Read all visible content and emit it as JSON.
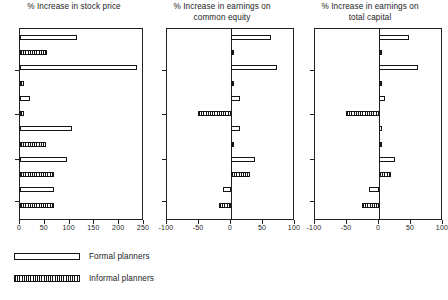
{
  "figure": {
    "width": 443,
    "height": 300,
    "background": "#ffffff",
    "ink_color": "#1a1a1a"
  },
  "legend": {
    "position": "bottom-left",
    "entries": [
      {
        "key": "formal",
        "label": "Formal planners",
        "pattern": "open"
      },
      {
        "key": "informal",
        "label": "Informal planners",
        "pattern": "hatched"
      }
    ]
  },
  "chart_data": [
    {
      "type": "bar",
      "orientation": "horizontal",
      "title": "% Increase in stock price",
      "xlabel": "",
      "ylabel": "",
      "xlim": [
        0,
        250
      ],
      "ticks": [
        0,
        50,
        100,
        150,
        200,
        250
      ],
      "tick_labels": [
        "0",
        "50",
        "100",
        "150",
        "200",
        "250"
      ],
      "grid": false,
      "zero_at": 0,
      "series": [
        {
          "name": "Formal planners",
          "pattern": "open"
        },
        {
          "name": "Informal planners",
          "pattern": "hatched"
        }
      ],
      "bars": [
        {
          "index": 1,
          "group": "formal",
          "value": 115
        },
        {
          "index": 2,
          "group": "informal",
          "value": 55
        },
        {
          "index": 3,
          "group": "formal",
          "value": 236
        },
        {
          "index": 4,
          "group": "informal",
          "value": 9
        },
        {
          "index": 5,
          "group": "formal",
          "value": 21
        },
        {
          "index": 6,
          "group": "informal",
          "value": 9
        },
        {
          "index": 7,
          "group": "formal",
          "value": 105
        },
        {
          "index": 8,
          "group": "informal",
          "value": 52
        },
        {
          "index": 9,
          "group": "formal",
          "value": 94
        },
        {
          "index": 10,
          "group": "informal",
          "value": 68
        },
        {
          "index": 11,
          "group": "formal",
          "value": 69
        },
        {
          "index": 12,
          "group": "informal",
          "value": 68
        }
      ]
    },
    {
      "type": "bar",
      "orientation": "horizontal",
      "title": "% Increase in earnings on\ncommon equity",
      "xlabel": "",
      "ylabel": "",
      "xlim": [
        -100,
        100
      ],
      "ticks": [
        -100,
        -50,
        0,
        50,
        100
      ],
      "tick_labels": [
        "-100",
        "-50",
        "0",
        "50",
        "100"
      ],
      "grid": false,
      "zero_at": 0,
      "series": [
        {
          "name": "Formal planners",
          "pattern": "open"
        },
        {
          "name": "Informal planners",
          "pattern": "hatched"
        }
      ],
      "bars": [
        {
          "index": 1,
          "group": "formal",
          "value": 62
        },
        {
          "index": 2,
          "group": "informal",
          "value": 4
        },
        {
          "index": 3,
          "group": "formal",
          "value": 72
        },
        {
          "index": 4,
          "group": "informal",
          "value": 4
        },
        {
          "index": 5,
          "group": "formal",
          "value": 14
        },
        {
          "index": 6,
          "group": "informal",
          "value": -52
        },
        {
          "index": 7,
          "group": "formal",
          "value": 14
        },
        {
          "index": 8,
          "group": "informal",
          "value": 4
        },
        {
          "index": 9,
          "group": "formal",
          "value": 37
        },
        {
          "index": 10,
          "group": "informal",
          "value": 29
        },
        {
          "index": 11,
          "group": "formal",
          "value": -12
        },
        {
          "index": 12,
          "group": "informal",
          "value": -18
        }
      ]
    },
    {
      "type": "bar",
      "orientation": "horizontal",
      "title": "% Increase in earnings on\ntotal capital",
      "xlabel": "",
      "ylabel": "",
      "xlim": [
        -100,
        100
      ],
      "ticks": [
        -100,
        -50,
        0,
        50,
        100
      ],
      "tick_labels": [
        "-100",
        "-50",
        "0",
        "50",
        "100"
      ],
      "grid": false,
      "zero_at": 0,
      "series": [
        {
          "name": "Formal planners",
          "pattern": "open"
        },
        {
          "name": "Informal planners",
          "pattern": "hatched"
        }
      ],
      "bars": [
        {
          "index": 1,
          "group": "formal",
          "value": 47
        },
        {
          "index": 2,
          "group": "informal",
          "value": 4
        },
        {
          "index": 3,
          "group": "formal",
          "value": 61
        },
        {
          "index": 4,
          "group": "informal",
          "value": 5
        },
        {
          "index": 5,
          "group": "formal",
          "value": 9
        },
        {
          "index": 6,
          "group": "informal",
          "value": -52
        },
        {
          "index": 7,
          "group": "formal",
          "value": 4
        },
        {
          "index": 8,
          "group": "informal",
          "value": 4
        },
        {
          "index": 9,
          "group": "formal",
          "value": 25
        },
        {
          "index": 10,
          "group": "informal",
          "value": 19
        },
        {
          "index": 11,
          "group": "formal",
          "value": -15
        },
        {
          "index": 12,
          "group": "informal",
          "value": -26
        }
      ]
    }
  ]
}
